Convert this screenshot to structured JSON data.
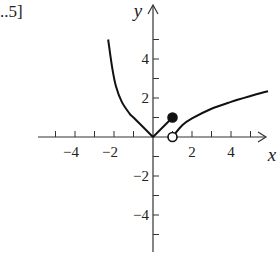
{
  "partial_text": "..5]",
  "chart_data": {
    "type": "line",
    "title": "",
    "xlabel": "x",
    "ylabel": "y",
    "xlim": [
      -5.5,
      6
    ],
    "ylim": [
      -6,
      6.5
    ],
    "x_tick_labels": [
      "-4",
      "-2",
      "2",
      "4"
    ],
    "x_tick_label_values": [
      -4,
      -2,
      2,
      4
    ],
    "x_ticks": [
      -5,
      -4,
      -3,
      -2,
      -1,
      1,
      2,
      3,
      4,
      5
    ],
    "y_tick_labels": [
      "4",
      "2",
      "-2",
      "-4"
    ],
    "y_tick_label_values": [
      4,
      2,
      -2,
      -4
    ],
    "y_ticks": [
      -5,
      -4,
      -3,
      -2,
      -1,
      1,
      2,
      3,
      4,
      5
    ],
    "grid": false,
    "series": [
      {
        "name": "left-branch",
        "description": "decreasing curve from top-left to origin",
        "points": [
          [
            -2.3,
            5.0
          ],
          [
            -2.1,
            3.6
          ],
          [
            -1.9,
            2.6
          ],
          [
            -1.6,
            1.8
          ],
          [
            -1.2,
            1.2
          ],
          [
            -1.0,
            1.0
          ],
          [
            0,
            0
          ]
        ]
      },
      {
        "name": "middle-segment",
        "description": "line y = x from origin to closed dot",
        "points": [
          [
            0,
            0
          ],
          [
            1,
            1
          ]
        ]
      },
      {
        "name": "right-branch",
        "description": "increasing sqrt-like curve starting at open circle",
        "points": [
          [
            1,
            0
          ],
          [
            1.5,
            0.6
          ],
          [
            2,
            0.95
          ],
          [
            3,
            1.45
          ],
          [
            4,
            1.8
          ],
          [
            5,
            2.1
          ],
          [
            5.9,
            2.35
          ]
        ]
      }
    ],
    "markers": [
      {
        "type": "closed",
        "x": 1,
        "y": 1
      },
      {
        "type": "open",
        "x": 1,
        "y": 0
      }
    ]
  },
  "colors": {
    "axis": "#333333",
    "curve": "#111111",
    "text": "#222222",
    "background": "#ffffff"
  }
}
